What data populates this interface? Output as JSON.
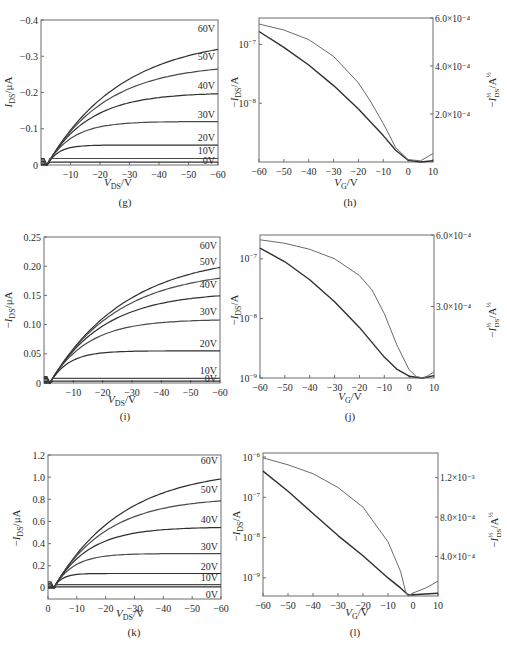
{
  "figure": {
    "panels": [
      "g",
      "h",
      "i",
      "j",
      "k",
      "l"
    ]
  },
  "chart_data": [
    {
      "id": "g",
      "caption": "(g)",
      "type": "line",
      "xlabel": "V_DS/V",
      "ylabel": "I_DS/μA",
      "xlim": [
        0,
        -60
      ],
      "ylim": [
        0,
        -0.4
      ],
      "xticks": [
        -10,
        -20,
        -30,
        -40,
        -50,
        -60
      ],
      "xtick_labels": [
        "−10",
        "−20",
        "−30",
        "−40",
        "−50",
        "−60"
      ],
      "yticks": [
        0,
        -0.1,
        -0.2,
        -0.3,
        -0.4
      ],
      "ytick_labels": [
        "0",
        "−0.1",
        "−0.2",
        "−0.3",
        "−0.4"
      ],
      "grid": false,
      "series_label_note": "curves labelled by gate voltage V_G",
      "series": [
        {
          "name": "60V",
          "sat": -0.355
        },
        {
          "name": "50V",
          "sat": -0.28
        },
        {
          "name": "40V",
          "sat": -0.2
        },
        {
          "name": "30V",
          "sat": -0.12
        },
        {
          "name": "20V",
          "sat": -0.055
        },
        {
          "name": "10V",
          "sat": -0.018
        },
        {
          "name": "0V",
          "sat": -0.008
        }
      ]
    },
    {
      "id": "h",
      "caption": "(h)",
      "type": "line",
      "xlabel": "V_G/V",
      "ylabel_left": "−I_DS/A",
      "ylabel_right": "−I_DS^(1/2)/A^(1/2)",
      "xlim": [
        -60,
        10
      ],
      "xticks": [
        -60,
        -50,
        -40,
        -30,
        -20,
        -10,
        0,
        10
      ],
      "xtick_labels": [
        "−60",
        "−50",
        "−40",
        "−30",
        "−20",
        "−10",
        "0",
        "10"
      ],
      "yscale_left": "log",
      "ylim_left_log10": [
        -9.0,
        -6.55
      ],
      "yticks_left_labels": [
        "10^-7",
        "10^-8"
      ],
      "yticks_left_log10": [
        -7,
        -8
      ],
      "ylim_right": [
        0,
        0.0006
      ],
      "yticks_right": [
        0.0002,
        0.0004,
        0.0006
      ],
      "yticks_right_labels": [
        "2.0×10⁻⁴",
        "4.0×10⁻⁴",
        "6.0×10⁻⁴"
      ],
      "series": [
        {
          "name": "log(-I_DS) transfer",
          "axis": "left",
          "x": [
            -60,
            -50,
            -40,
            -30,
            -20,
            -10,
            -5,
            0,
            5,
            10
          ],
          "log10_y": [
            -6.78,
            -7.05,
            -7.35,
            -7.7,
            -8.1,
            -8.55,
            -8.8,
            -8.97,
            -9.0,
            -8.98
          ]
        },
        {
          "name": "sqrt(-I_DS)",
          "axis": "right",
          "x": [
            -60,
            -50,
            -40,
            -30,
            -20,
            -15,
            -10,
            -5,
            0,
            5,
            10
          ],
          "y": [
            0.000575,
            0.00055,
            0.00051,
            0.00044,
            0.00033,
            0.00025,
            0.00016,
            6e-05,
            1e-05,
            5e-06,
            3.5e-05
          ]
        }
      ]
    },
    {
      "id": "i",
      "caption": "(i)",
      "type": "line",
      "xlabel": "V_DS/V",
      "ylabel": "−I_DS/μA",
      "xlim": [
        0,
        -60
      ],
      "ylim": [
        0,
        0.25
      ],
      "xticks": [
        -10,
        -20,
        -30,
        -40,
        -50,
        -60
      ],
      "xtick_labels": [
        "−10",
        "−20",
        "−30",
        "−40",
        "−50",
        "−60"
      ],
      "yticks": [
        0,
        0.05,
        0.1,
        0.15,
        0.2,
        0.25
      ],
      "ytick_labels": [
        "0",
        "0.05",
        "0.10",
        "0.15",
        "0.20",
        "0.25"
      ],
      "grid": false,
      "series": [
        {
          "name": "60V",
          "sat": 0.222
        },
        {
          "name": "50V",
          "sat": 0.195
        },
        {
          "name": "40V",
          "sat": 0.156
        },
        {
          "name": "30V",
          "sat": 0.109
        },
        {
          "name": "20V",
          "sat": 0.055
        },
        {
          "name": "10V",
          "sat": 0.008
        },
        {
          "name": "0V",
          "sat": 0.003
        }
      ]
    },
    {
      "id": "j",
      "caption": "(j)",
      "type": "line",
      "xlabel": "V_G/V",
      "ylabel_left": "−I_DS/A",
      "ylabel_right": "−I_DS^(1/2)/A^(1/2)",
      "xlim": [
        -60,
        10
      ],
      "xticks": [
        -60,
        -50,
        -40,
        -30,
        -20,
        -10,
        0,
        10
      ],
      "xtick_labels": [
        "−60",
        "−50",
        "−40",
        "−30",
        "−20",
        "−10",
        "0",
        "10"
      ],
      "yscale_left": "log",
      "ylim_left_log10": [
        -9.0,
        -6.6
      ],
      "yticks_left_labels": [
        "10^-7",
        "10^-8",
        "10^-9"
      ],
      "yticks_left_log10": [
        -7,
        -8,
        -9
      ],
      "ylim_right": [
        0,
        0.0006
      ],
      "yticks_right": [
        0.0003,
        0.0006
      ],
      "yticks_right_labels": [
        "3.0×10⁻⁴",
        "6.0×10⁻⁴"
      ],
      "series": [
        {
          "name": "log(-I_DS) transfer",
          "axis": "left",
          "x": [
            -60,
            -50,
            -40,
            -30,
            -20,
            -10,
            -5,
            0,
            5,
            8,
            10
          ],
          "log10_y": [
            -6.82,
            -7.05,
            -7.35,
            -7.72,
            -8.15,
            -8.65,
            -8.85,
            -8.97,
            -9.0,
            -8.98,
            -8.96
          ]
        },
        {
          "name": "sqrt(-I_DS)",
          "axis": "right",
          "x": [
            -60,
            -50,
            -40,
            -30,
            -20,
            -15,
            -10,
            -5,
            0,
            3,
            6,
            10
          ],
          "y": [
            0.00058,
            0.000565,
            0.00054,
            0.0005,
            0.00043,
            0.00037,
            0.00027,
            0.00014,
            3.5e-05,
            5e-06,
            0.0,
            2.5e-05
          ]
        }
      ]
    },
    {
      "id": "k",
      "caption": "(k)",
      "type": "line",
      "xlabel": "V_DS/V",
      "ylabel": "−I_DS/μA",
      "xlim": [
        0,
        -60
      ],
      "ylim": [
        -0.1,
        1.2
      ],
      "xticks": [
        0,
        -10,
        -20,
        -30,
        -40,
        -50,
        -60
      ],
      "xtick_labels": [
        "0",
        "−10",
        "−20",
        "−30",
        "−40",
        "−50",
        "−60"
      ],
      "yticks": [
        0,
        0.2,
        0.4,
        0.6,
        0.8,
        1.0,
        1.2
      ],
      "ytick_labels": [
        "0",
        "0.2",
        "0.4",
        "0.6",
        "0.8",
        "1.0",
        "1.2"
      ],
      "grid": false,
      "series": [
        {
          "name": "60V",
          "sat": 1.08
        },
        {
          "name": "50V",
          "sat": 0.82
        },
        {
          "name": "40V",
          "sat": 0.55
        },
        {
          "name": "30V",
          "sat": 0.31
        },
        {
          "name": "20V",
          "sat": 0.13
        },
        {
          "name": "10V",
          "sat": 0.03
        },
        {
          "name": "0V",
          "sat": 0.01
        }
      ]
    },
    {
      "id": "l",
      "caption": "(l)",
      "type": "line",
      "xlabel": "V_G/V",
      "ylabel_left": "−I_DS/A",
      "ylabel_right": "−I_DS^(1/2)/A^(1/2)",
      "xlim": [
        -60,
        10
      ],
      "xticks": [
        -60,
        -50,
        -40,
        -30,
        -20,
        -10,
        0,
        10
      ],
      "xtick_labels": [
        "−60",
        "−50",
        "−40",
        "−30",
        "−20",
        "−10",
        "0",
        "10"
      ],
      "yscale_left": "log",
      "ylim_left_log10": [
        -9.45,
        -5.9
      ],
      "yticks_left_labels": [
        "10^-6",
        "10^-7",
        "10^-8",
        "10^-9"
      ],
      "yticks_left_log10": [
        -6,
        -7,
        -8,
        -9
      ],
      "ylim_right": [
        0,
        0.00145
      ],
      "yticks_right": [
        0.0004,
        0.0008,
        0.0012
      ],
      "yticks_right_labels": [
        "4.0×10⁻⁴",
        "8.0×10⁻⁴",
        "1.2×10⁻³"
      ],
      "series": [
        {
          "name": "log(-I_DS) transfer",
          "axis": "left",
          "x": [
            -60,
            -50,
            -40,
            -30,
            -20,
            -10,
            -5,
            -2,
            0,
            5,
            10
          ],
          "log10_y": [
            -6.35,
            -6.85,
            -7.4,
            -7.95,
            -8.45,
            -9.0,
            -9.25,
            -9.42,
            -9.42,
            -9.4,
            -9.38
          ]
        },
        {
          "name": "sqrt(-I_DS)",
          "axis": "right",
          "x": [
            -60,
            -50,
            -40,
            -30,
            -20,
            -10,
            -5,
            -3,
            -2,
            0,
            5,
            10
          ],
          "y": [
            0.0014,
            0.00133,
            0.00124,
            0.0011,
            0.0009,
            0.00055,
            0.00025,
            5e-05,
            0.0,
            3e-05,
            8e-05,
            0.00015
          ]
        }
      ]
    }
  ]
}
